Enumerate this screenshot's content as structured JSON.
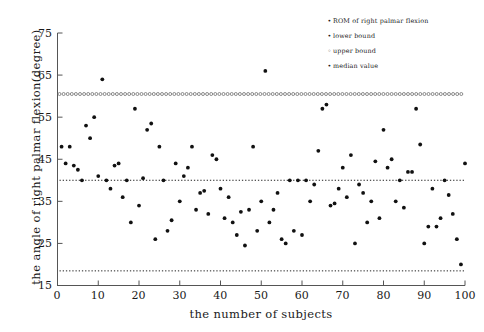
{
  "chart_data": {
    "type": "scatter",
    "title": "",
    "xlabel": "the number of subjects",
    "ylabel": "the angle of right palmar flexion(degree)",
    "xlim": [
      0,
      100
    ],
    "ylim": [
      15,
      75
    ],
    "xticks": [
      0,
      10,
      20,
      30,
      40,
      50,
      60,
      70,
      80,
      90,
      100
    ],
    "yticks": [
      15,
      25,
      35,
      45,
      55,
      65,
      75
    ],
    "grid": false,
    "legend_position": "top-right",
    "legend": [
      {
        "marker": "dot",
        "label": "ROM of right palmar flexion"
      },
      {
        "marker": "dot",
        "label": "lower bound"
      },
      {
        "marker": "circle",
        "label": "upper bound"
      },
      {
        "marker": "dot",
        "label": "median value"
      }
    ],
    "reference_lines": [
      {
        "name": "upper bound",
        "value": 60.5,
        "style": "dotted-open-circles"
      },
      {
        "name": "median value",
        "value": 40.0,
        "style": "dotted"
      },
      {
        "name": "lower bound",
        "value": 18.5,
        "style": "dotted"
      }
    ],
    "series": [
      {
        "name": "ROM of right palmar flexion",
        "marker": "dot",
        "x": [
          1,
          2,
          3,
          4,
          5,
          6,
          7,
          8,
          9,
          10,
          11,
          12,
          13,
          14,
          15,
          16,
          17,
          18,
          19,
          20,
          21,
          22,
          23,
          24,
          25,
          26,
          27,
          28,
          29,
          30,
          31,
          32,
          33,
          34,
          35,
          36,
          37,
          38,
          39,
          40,
          41,
          42,
          43,
          44,
          45,
          46,
          47,
          48,
          49,
          50,
          51,
          52,
          53,
          54,
          55,
          56,
          57,
          58,
          59,
          60,
          61,
          62,
          63,
          64,
          65,
          66,
          67,
          68,
          69,
          70,
          71,
          72,
          73,
          74,
          75,
          76,
          77,
          78,
          79,
          80,
          81,
          82,
          83,
          84,
          85,
          86,
          87,
          88,
          89,
          90,
          91,
          92,
          93,
          94,
          95,
          96,
          97,
          98,
          99,
          100
        ],
        "y": [
          48,
          44,
          48,
          43.5,
          42.5,
          40,
          53,
          50,
          55,
          41,
          64,
          40,
          38,
          43.5,
          44,
          36,
          40,
          30,
          57,
          34,
          40.5,
          52,
          53.5,
          26,
          48,
          40,
          28,
          30.5,
          44,
          35,
          41,
          43,
          48,
          33,
          37,
          37.5,
          32,
          46,
          45,
          38,
          31,
          36,
          30,
          27,
          32.5,
          24.5,
          33,
          48,
          28,
          35,
          66,
          30,
          33,
          37,
          26,
          25,
          40,
          28,
          40,
          27,
          40,
          35,
          39,
          47,
          57,
          58,
          34,
          34.5,
          38,
          43,
          36,
          46,
          25,
          39,
          37,
          30,
          35,
          44.5,
          31,
          52,
          43,
          45,
          35,
          40,
          33.5,
          42,
          42,
          57,
          48.5,
          25,
          29,
          38,
          29,
          31,
          40,
          36.5,
          32,
          26,
          20,
          44
        ]
      }
    ]
  }
}
